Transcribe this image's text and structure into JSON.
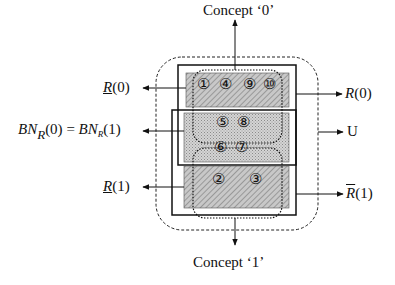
{
  "diagram": {
    "type": "rough-set-regions",
    "concept_top_label": "Concept ‘0’",
    "concept_bottom_label": "Concept ‘1’",
    "labels": {
      "lower_approx_0": {
        "symbol": "R",
        "arg": "(0)",
        "decoration": "underline"
      },
      "upper_approx_0": {
        "symbol": "R",
        "arg": "(0)",
        "decoration": "overline"
      },
      "boundary": {
        "left": "BN",
        "left_sub": "R",
        "left_arg": "(0)",
        "equals": "=",
        "right": "BN",
        "right_sub": "R",
        "right_arg": "(1)"
      },
      "universe": "U",
      "lower_approx_1": {
        "symbol": "R",
        "arg": "(1)",
        "decoration": "underline"
      },
      "upper_approx_1": {
        "symbol": "R",
        "arg": "(1)",
        "decoration": "overline"
      }
    },
    "regions": {
      "lower_0_objects": [
        "①",
        "④",
        "⑨",
        "⑩"
      ],
      "boundary_top_objects": [
        "⑤",
        "⑧"
      ],
      "boundary_bottom_objects": [
        "⑥",
        "⑦"
      ],
      "lower_1_objects": [
        "②",
        "③"
      ]
    },
    "colors": {
      "line": "#111111",
      "hatch_fill": "#bdbdbd",
      "crosshatch_fill": "#cfcfcf",
      "background": "#ffffff"
    }
  }
}
